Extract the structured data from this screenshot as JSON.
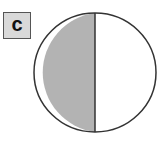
{
  "label": "c",
  "diagram": {
    "type": "fraction-circle",
    "parts": 2,
    "shaded_parts": 1,
    "shaded_side": "left",
    "colors": {
      "shaded": "#b3b3b3",
      "unshaded": "#ffffff",
      "stroke": "#333333",
      "label_bg": "#d9d9d9"
    }
  }
}
